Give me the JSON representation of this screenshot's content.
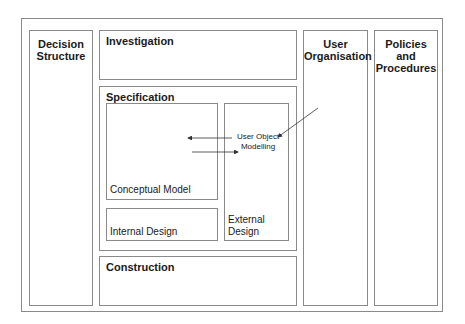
{
  "diagram": {
    "columns": {
      "decision": "Decision Structure",
      "user_org": "User Organisation",
      "policies": "Policies and Procedures"
    },
    "phases": {
      "investigation": "Investigation",
      "specification": "Specification",
      "construction": "Construction"
    },
    "specification_parts": {
      "conceptual": "Conceptual Model",
      "internal": "Internal Design",
      "external": "External Design"
    },
    "annotation": {
      "line1": "User Object",
      "line2": "Modelling"
    },
    "colors": {
      "border": "#8a8a8a",
      "text": "#1a1a1a",
      "arrow": "#333333"
    }
  }
}
